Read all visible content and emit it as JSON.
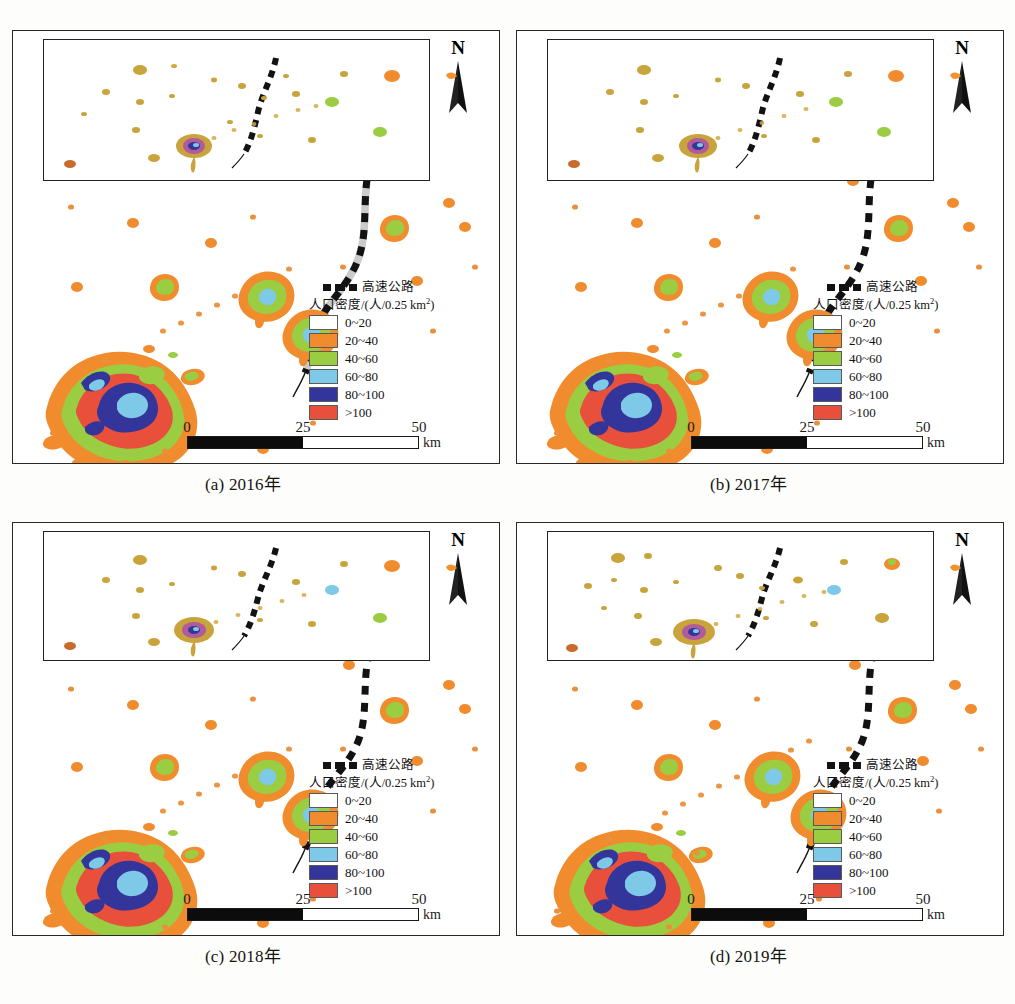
{
  "figure": {
    "type": "map-grid",
    "rows": 2,
    "cols": 2,
    "north_label": "N",
    "unit_label": "km"
  },
  "panels": [
    {
      "id": "a",
      "caption": "(a) 2016年",
      "year": "2016"
    },
    {
      "id": "b",
      "caption": "(b) 2017年",
      "year": "2017"
    },
    {
      "id": "c",
      "caption": "(c) 2018年",
      "year": "2018"
    },
    {
      "id": "d",
      "caption": "(d) 2019年",
      "year": "2019"
    }
  ],
  "legend": {
    "highway_label": "高速公路",
    "title_main": "人口密度/(人/0.25 km",
    "title_sup": "2",
    "title_tail": ")",
    "classes": [
      {
        "label": "0~20",
        "color": "#ffffff"
      },
      {
        "label": "20~40",
        "color": "#f08c2e"
      },
      {
        "label": "40~60",
        "color": "#9acd42"
      },
      {
        "label": "60~80",
        "color": "#7ec8e8"
      },
      {
        "label": "80~100",
        "color": "#33359b"
      },
      {
        "label": ">100",
        "color": "#e8503c"
      }
    ]
  },
  "scalebar": {
    "ticks": [
      "0",
      "25",
      "50"
    ],
    "unit": "km",
    "max_km": 50
  },
  "colors": {
    "c0": "#ffffff",
    "c20": "#f08c2e",
    "c40": "#9acd42",
    "c60": "#7ec8e8",
    "c80": "#33359b",
    "c100": "#e8503c",
    "highway": "#121212",
    "border": "#2a2a2a",
    "text": "#15150f"
  }
}
